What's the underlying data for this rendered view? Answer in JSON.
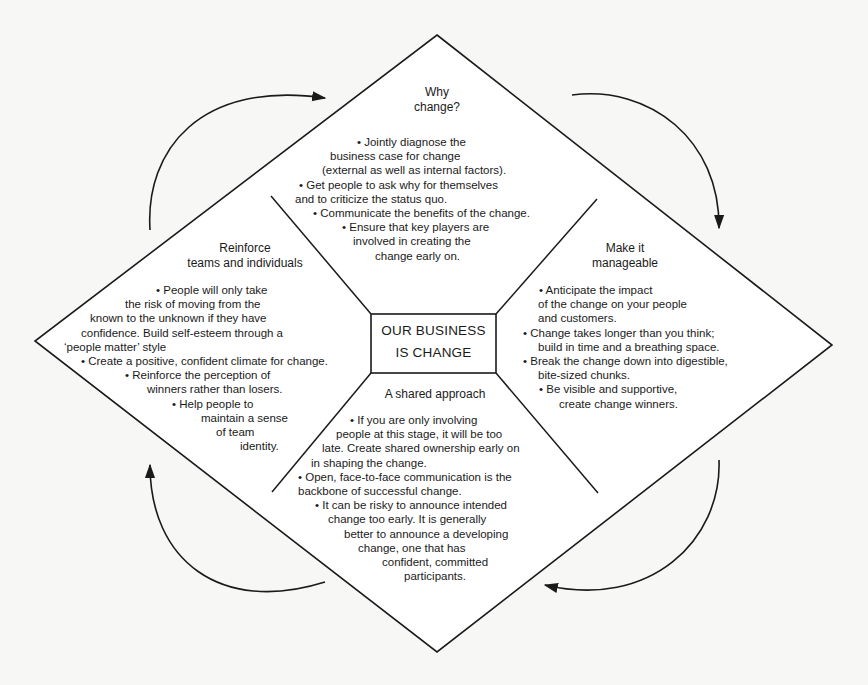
{
  "diagram": {
    "center": {
      "lines": [
        "OUR BUSINESS",
        "IS CHANGE"
      ]
    },
    "sections": {
      "top": {
        "title_lines": [
          "Why",
          "change?"
        ],
        "lines": [
          "•   Jointly diagnose the",
          "business case for change",
          "(external as well as internal factors).",
          "•   Get people to ask why for themselves",
          "and to criticize the status quo.",
          "•   Communicate the benefits of the change.",
          "•   Ensure that key players are",
          "involved in creating the",
          "change early on."
        ]
      },
      "right": {
        "title_lines": [
          "Make it",
          "manageable"
        ],
        "lines": [
          "•   Anticipate the impact",
          "of the change on your people",
          "and customers.",
          "•   Change takes longer than you think;",
          "build in time and a breathing space.",
          "•   Break the change down into digestible,",
          "bite-sized chunks.",
          "•   Be visible and supportive,",
          "create change winners."
        ]
      },
      "bottom": {
        "title_lines": [
          "A shared approach"
        ],
        "lines": [
          "•   If you are only involving",
          "people at this stage, it will be too",
          "late. Create shared ownership early on",
          "in shaping the change.",
          "•   Open, face-to-face communication is the",
          "backbone of successful change.",
          "•   It can be risky to announce intended",
          "change too early. It is generally",
          "better to announce a developing",
          "change, one that has",
          "confident, committed",
          "participants."
        ]
      },
      "left": {
        "title_lines": [
          "Reinforce",
          "teams and individuals"
        ],
        "lines": [
          "•   People will only take",
          "the risk of moving from the",
          "known to the unknown if they have",
          "confidence. Build self-esteem through a",
          "‘people matter’ style",
          "•   Create a positive, confident climate for change.",
          "•   Reinforce the perception of",
          "winners rather than losers.",
          "•   Help people to",
          "maintain a sense",
          "of team",
          "identity."
        ]
      }
    },
    "arrows": [
      {
        "name": "arrow-top-left",
        "direction": "clockwise",
        "points_to": "top"
      },
      {
        "name": "arrow-top-right",
        "direction": "clockwise",
        "points_to": "right"
      },
      {
        "name": "arrow-bottom-right",
        "direction": "clockwise",
        "points_to": "bottom"
      },
      {
        "name": "arrow-bottom-left",
        "direction": "clockwise",
        "points_to": "left"
      }
    ],
    "colors": {
      "ink": "#1a1a1a",
      "paper": "#f7f7f5"
    }
  }
}
